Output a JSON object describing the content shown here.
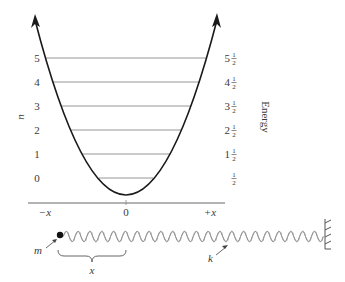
{
  "figure": {
    "left_axis_label": "n",
    "right_axis_label": "Energy",
    "levels": [
      {
        "n": "0",
        "energy_whole": "",
        "energy_frac": "1/2",
        "y": 178,
        "x1": 99,
        "x2": 153
      },
      {
        "n": "1",
        "energy_whole": "1",
        "energy_frac": "1/2",
        "y": 154,
        "x1": 82,
        "x2": 170
      },
      {
        "n": "2",
        "energy_whole": "2",
        "energy_frac": "1/2",
        "y": 130,
        "x1": 71,
        "x2": 181
      },
      {
        "n": "3",
        "energy_whole": "3",
        "energy_frac": "1/2",
        "y": 106,
        "x1": 61,
        "x2": 191
      },
      {
        "n": "4",
        "energy_whole": "4",
        "energy_frac": "1/2",
        "y": 82,
        "x1": 52,
        "x2": 200
      },
      {
        "n": "5",
        "energy_whole": "5",
        "energy_frac": "1/2",
        "y": 58,
        "x1": 45,
        "x2": 207
      }
    ],
    "x_axis": {
      "ticks": [
        "−x",
        "0",
        "+x"
      ]
    },
    "spring": {
      "mass_label": "m",
      "displacement_label": "x",
      "spring_constant_label": "k"
    }
  },
  "colors": {
    "curve": "#1a1a1a",
    "level_lines": "#8a8a8a",
    "text": "#3a3a3a",
    "spring": "#7a7a7a"
  }
}
